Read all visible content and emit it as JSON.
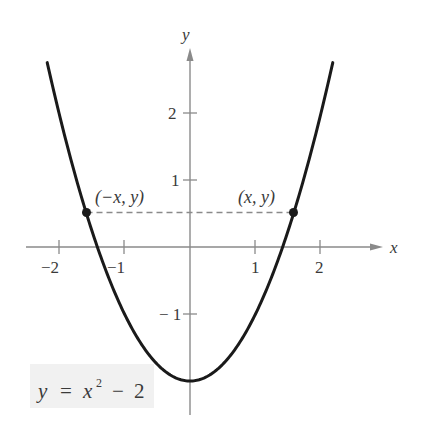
{
  "chart_data": {
    "type": "line",
    "title": "",
    "equation_label": "y = x² − 2",
    "function": "y = x^2 - 2",
    "xlabel": "x",
    "ylabel": "y",
    "xlim": [
      -2.3,
      2.3
    ],
    "ylim": [
      -2.5,
      2.8
    ],
    "x_ticks": [
      -2,
      -1,
      1,
      2
    ],
    "x_tick_labels": [
      "−2",
      "−1",
      "1",
      "2"
    ],
    "y_ticks": [
      2,
      1,
      -1
    ],
    "y_tick_labels": [
      "2",
      "1",
      "−1"
    ],
    "grid": false,
    "legend": null,
    "series": [
      {
        "name": "y = x^2 - 2",
        "x": [
          -2.18,
          -2,
          -1.5,
          -1,
          -0.5,
          0,
          0.5,
          1,
          1.5,
          2,
          2.18
        ],
        "y": [
          2.75,
          2,
          0.25,
          -1,
          -1.75,
          -2,
          -1.75,
          -1,
          0.25,
          2,
          2.75
        ]
      }
    ],
    "points": [
      {
        "label": "(−x, y)",
        "x": -1.58,
        "y": 0.5
      },
      {
        "label": "(x, y)",
        "x": 1.58,
        "y": 0.5
      }
    ],
    "annotations": [
      {
        "type": "dashed-line",
        "from": [
          -1.58,
          0.5
        ],
        "to": [
          1.58,
          0.5
        ],
        "description": "horizontal dashed segment joining symmetric points"
      }
    ]
  },
  "labels": {
    "x_axis": "x",
    "y_axis": "y",
    "point_left": "(−x,  y)",
    "point_right": "(x, y)",
    "equation": {
      "lhs": "y",
      "eq": "=",
      "var": "x",
      "exp": "2",
      "minus": "−",
      "const": "2"
    },
    "ticks": {
      "x_m2": "−2",
      "x_m1": "−1",
      "x_1": "1",
      "x_2": "2",
      "y_2": "2",
      "y_1": "1",
      "y_m1": "− 1"
    }
  },
  "colors": {
    "curve": "#1a1a1a",
    "axis": "#8a8a8a",
    "text": "#3a3a3a",
    "equation_bg": "#f1f1f1"
  }
}
